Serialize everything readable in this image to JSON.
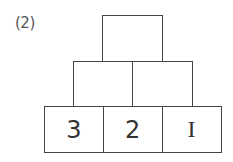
{
  "problem_label": "(2)",
  "pyramid": {
    "rows": [
      {
        "cells": [
          ""
        ]
      },
      {
        "cells": [
          "",
          ""
        ]
      },
      {
        "cells": [
          "3",
          "2",
          "I"
        ]
      }
    ]
  },
  "colors": {
    "line": "#444444",
    "text": "#333333",
    "background": "#ffffff"
  }
}
